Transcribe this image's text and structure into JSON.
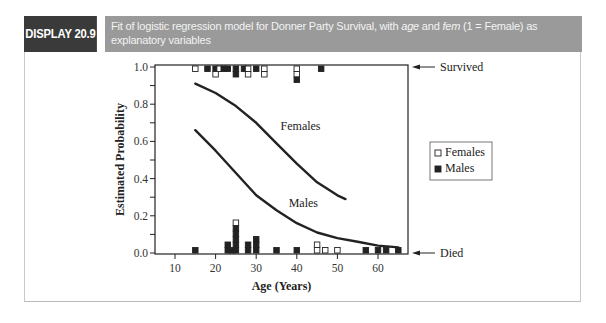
{
  "header": {
    "display_label": "DISPLAY 20.9",
    "caption_part1": "Fit of logistic regression model for Donner Party Survival, with ",
    "caption_var1": "age",
    "caption_part2": " and ",
    "caption_var2": "fem",
    "caption_part3": " (1 = Female) as explanatory variables"
  },
  "colors": {
    "label_bg": "#3a3a3a",
    "caption_bg": "#9a9a9a",
    "ink": "#222222"
  },
  "chart_data": {
    "type": "line",
    "title": "Fit of logistic regression model for Donner Party Survival, with age and fem (1 = Female) as explanatory variables",
    "xlabel": "Age (Years)",
    "ylabel": "Estimated Probability",
    "xlim": [
      5,
      68
    ],
    "ylim": [
      0.0,
      1.0
    ],
    "x_ticks": [
      10,
      20,
      30,
      40,
      50,
      60
    ],
    "y_ticks": [
      0.0,
      0.2,
      0.4,
      0.6,
      0.8,
      1.0
    ],
    "y_minor_ticks": [
      0.1,
      0.3,
      0.5,
      0.7,
      0.9
    ],
    "grid": false,
    "series": [
      {
        "name": "Females",
        "x": [
          15,
          20,
          25,
          30,
          35,
          40,
          45,
          50,
          52
        ],
        "y": [
          0.91,
          0.86,
          0.79,
          0.7,
          0.59,
          0.48,
          0.38,
          0.31,
          0.29
        ]
      },
      {
        "name": "Males",
        "x": [
          15,
          20,
          25,
          30,
          35,
          40,
          45,
          50,
          55,
          60,
          65
        ],
        "y": [
          0.66,
          0.55,
          0.43,
          0.31,
          0.23,
          0.16,
          0.11,
          0.08,
          0.06,
          0.04,
          0.03
        ]
      }
    ],
    "curve_labels": [
      {
        "text": "Females",
        "x": 36,
        "y": 0.66
      },
      {
        "text": "Males",
        "x": 38,
        "y": 0.25
      }
    ],
    "observations": {
      "survived_level": 1.0,
      "died_level": 0.0,
      "survived": [
        {
          "age": 15,
          "sex": "F",
          "count": 1
        },
        {
          "age": 18,
          "sex": "M",
          "count": 1
        },
        {
          "age": 20,
          "sex": "M",
          "count": 1
        },
        {
          "age": 20,
          "sex": "F",
          "count": 1
        },
        {
          "age": 21,
          "sex": "F",
          "count": 1
        },
        {
          "age": 22,
          "sex": "M",
          "count": 1
        },
        {
          "age": 23,
          "sex": "M",
          "count": 1
        },
        {
          "age": 25,
          "sex": "M",
          "count": 2
        },
        {
          "age": 27,
          "sex": "M",
          "count": 1
        },
        {
          "age": 28,
          "sex": "F",
          "count": 2
        },
        {
          "age": 30,
          "sex": "M",
          "count": 1
        },
        {
          "age": 32,
          "sex": "F",
          "count": 2
        },
        {
          "age": 40,
          "sex": "F",
          "count": 2
        },
        {
          "age": 40,
          "sex": "M",
          "count": 1
        },
        {
          "age": 46,
          "sex": "M",
          "count": 1
        }
      ],
      "died": [
        {
          "age": 15,
          "sex": "M",
          "count": 1
        },
        {
          "age": 23,
          "sex": "M",
          "count": 2
        },
        {
          "age": 24,
          "sex": "M",
          "count": 1
        },
        {
          "age": 25,
          "sex": "M",
          "count": 5
        },
        {
          "age": 25,
          "sex": "F",
          "count": 1
        },
        {
          "age": 28,
          "sex": "M",
          "count": 2
        },
        {
          "age": 30,
          "sex": "M",
          "count": 3
        },
        {
          "age": 35,
          "sex": "M",
          "count": 1
        },
        {
          "age": 40,
          "sex": "M",
          "count": 1
        },
        {
          "age": 45,
          "sex": "F",
          "count": 2
        },
        {
          "age": 47,
          "sex": "F",
          "count": 1
        },
        {
          "age": 50,
          "sex": "F",
          "count": 1
        },
        {
          "age": 57,
          "sex": "M",
          "count": 1
        },
        {
          "age": 60,
          "sex": "M",
          "count": 1
        },
        {
          "age": 62,
          "sex": "M",
          "count": 1
        },
        {
          "age": 65,
          "sex": "M",
          "count": 1
        }
      ]
    },
    "annotations": [
      {
        "text": "Survived",
        "at_y": 1.0,
        "arrow": "left"
      },
      {
        "text": "Died",
        "at_y": 0.0,
        "arrow": "left"
      }
    ],
    "legend": {
      "position": "right",
      "entries": [
        {
          "label": "Females",
          "marker": "open-square"
        },
        {
          "label": "Males",
          "marker": "filled-square"
        }
      ]
    }
  }
}
